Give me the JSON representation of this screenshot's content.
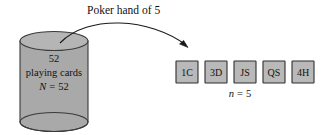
{
  "figure": {
    "title_label": "Poker hand of 5",
    "population": {
      "count_label": "52",
      "name_label": "playing cards",
      "size_var": "N",
      "size_eq": "=",
      "size_value": "52"
    },
    "sample": {
      "cards": [
        {
          "label": "1C"
        },
        {
          "label": "3D"
        },
        {
          "label": "JS"
        },
        {
          "label": "QS"
        },
        {
          "label": "4H"
        }
      ],
      "size_var": "n",
      "size_eq": "=",
      "size_value": "5"
    },
    "colors": {
      "cylinder_fill": "#a9a9a9",
      "cylinder_top_fill": "#b5b5b5",
      "cylinder_stroke": "#3a3a3a",
      "card_fill": "#b9b9b9",
      "card_stroke": "#2e2e2e",
      "arrow_stroke": "#1a1a1a",
      "text_color": "#111111",
      "background": "#ffffff"
    }
  }
}
